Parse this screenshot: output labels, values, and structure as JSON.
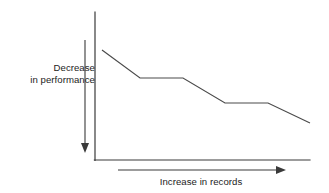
{
  "figure": {
    "kind": "schematic-line-chart",
    "background_color": "#ffffff",
    "line_color": "#4a4a4a",
    "axis_color": "#3a3a3a",
    "text_color": "#1c1c1c"
  },
  "labels": {
    "y_axis_line1": "Decrease",
    "y_axis_line2": "in performance",
    "y_axis_full": "Decrease in performance",
    "x_axis": "Increase in records"
  },
  "icons": {
    "y_arrow": "arrow-down-icon",
    "x_arrow": "arrow-right-icon"
  },
  "chart_data": {
    "type": "line",
    "title": "",
    "subtitle": "",
    "xlabel": "Increase in records",
    "ylabel": "Decrease in performance",
    "grid": false,
    "legend": false,
    "axis_ticks": false,
    "xlim": [
      0,
      100
    ],
    "ylim": [
      0,
      100
    ],
    "y_direction": "decreasing-downward",
    "annotations": [
      {
        "name": "y-axis-arrow",
        "direction": "down",
        "text": "Decrease in performance"
      },
      {
        "name": "x-axis-arrow",
        "direction": "right",
        "text": "Increase in records"
      }
    ],
    "series": [
      {
        "name": "performance",
        "x": [
          3,
          21,
          41,
          62,
          81,
          100
        ],
        "y": [
          74,
          55,
          55,
          38,
          38,
          24
        ],
        "points_px": [
          {
            "x": 102,
            "y": 50
          },
          {
            "x": 140,
            "y": 78
          },
          {
            "x": 183,
            "y": 78
          },
          {
            "x": 225,
            "y": 103
          },
          {
            "x": 268,
            "y": 103
          },
          {
            "x": 310,
            "y": 123
          }
        ]
      }
    ]
  },
  "geometry": {
    "y_axis": {
      "x": 95,
      "y_top": 12,
      "y_bottom": 160
    },
    "x_axis": {
      "y": 160,
      "x_left": 95,
      "x_right": 310
    },
    "y_arrow": {
      "x": 85,
      "y_top": 40,
      "y_bottom": 152
    },
    "x_arrow": {
      "y": 170,
      "x_left": 118,
      "x_right": 285
    }
  }
}
